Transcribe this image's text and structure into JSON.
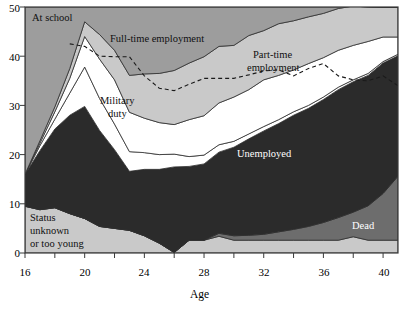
{
  "chart_data": {
    "type": "area",
    "title": "",
    "xlabel": "Age",
    "ylabel": "",
    "xlim": [
      16,
      41
    ],
    "ylim": [
      0,
      50
    ],
    "xticks": [
      16,
      20,
      24,
      28,
      32,
      36,
      40
    ],
    "xticks_minor_step": 2,
    "yticks": [
      0,
      10,
      20,
      30,
      40,
      50
    ],
    "grid": false,
    "legend": "inline-area-labels",
    "stacked": true,
    "x": [
      16,
      17,
      18,
      19,
      20,
      21,
      22,
      23,
      24,
      25,
      26,
      27,
      28,
      29,
      30,
      31,
      32,
      33,
      34,
      35,
      36,
      37,
      38,
      39,
      40,
      41
    ],
    "series": [
      {
        "name": "Status unknown or too young",
        "color": "#c9c9c9",
        "values": [
          9.5,
          8.8,
          9.2,
          8.0,
          7.0,
          5.4,
          5.0,
          4.6,
          3.5,
          2.0,
          0.1,
          2.6,
          2.6,
          3.4,
          2.6,
          2.6,
          2.6,
          2.6,
          2.6,
          2.6,
          2.6,
          2.6,
          3.3,
          2.6,
          2.6,
          2.6
        ]
      },
      {
        "name": "Dead",
        "color": "#6d6d6d",
        "values": [
          0,
          0,
          0,
          0,
          0,
          0,
          0,
          0,
          0,
          0,
          0,
          0,
          0,
          0.6,
          0.9,
          1.0,
          1.2,
          1.7,
          2.2,
          2.8,
          3.6,
          4.6,
          5.0,
          7.0,
          9.5,
          13.0
        ]
      },
      {
        "name": "Unemployed",
        "color": "#2b2b2b",
        "values": [
          6.5,
          12.0,
          16.0,
          20.0,
          22.8,
          19.5,
          16.0,
          12.0,
          13.5,
          15.0,
          17.4,
          15.0,
          15.5,
          16.5,
          18.0,
          19.6,
          21.0,
          22.0,
          23.2,
          24.0,
          25.0,
          26.0,
          26.5,
          26.5,
          26.5,
          24.5
        ]
      },
      {
        "name": "Military duty",
        "color": "#ffffff",
        "values": [
          0.0,
          1.0,
          2.0,
          4.5,
          8.0,
          6.5,
          5.2,
          4.0,
          3.4,
          3.0,
          2.6,
          2.0,
          1.8,
          1.5,
          1.2,
          1.0,
          0.9,
          0.8,
          0.7,
          0.6,
          0.5,
          0.5,
          0.4,
          0.4,
          0.3,
          0.3
        ]
      },
      {
        "name": "Full-time employment",
        "color": "#ffffff",
        "values": [
          0.0,
          0.5,
          1.5,
          3.0,
          6.2,
          8.0,
          9.0,
          8.0,
          7.0,
          6.5,
          6.0,
          7.5,
          8.0,
          8.5,
          9.0,
          9.0,
          9.5,
          9.0,
          8.5,
          8.5,
          8.0,
          7.5,
          7.0,
          6.5,
          5.0,
          3.5
        ]
      },
      {
        "name": "Part-time employment",
        "color": "#c9c9c9",
        "values": [
          0.0,
          0.5,
          1.0,
          2.0,
          3.0,
          5.0,
          6.0,
          7.5,
          9.0,
          10.0,
          11.0,
          11.5,
          12.0,
          11.5,
          10.5,
          11.0,
          10.0,
          10.5,
          10.0,
          9.5,
          9.0,
          8.5,
          8.0,
          7.0,
          6.0,
          6.0
        ]
      },
      {
        "name": "At school",
        "color": "#9d9d9d",
        "values": [
          34.0,
          27.2,
          20.3,
          12.5,
          3.0,
          5.6,
          8.8,
          13.9,
          13.6,
          13.5,
          12.9,
          11.4,
          10.1,
          8.0,
          7.8,
          5.8,
          4.8,
          3.4,
          2.8,
          2.0,
          1.3,
          0.3,
          0.0,
          0.0,
          0.0,
          0.0
        ]
      }
    ],
    "dashed_line": {
      "name": "military-fulltime-divider",
      "x": [
        19,
        20,
        21,
        22,
        23,
        24,
        25,
        26,
        27,
        28,
        29,
        30,
        31,
        32,
        33,
        34,
        35,
        36,
        37,
        38,
        39,
        40,
        41
      ],
      "y": [
        42.5,
        42.0,
        40.0,
        39.9,
        39.9,
        36.0,
        33.5,
        33.0,
        34.3,
        35.5,
        35.5,
        35.5,
        36.2,
        37.0,
        37.2,
        36.0,
        37.5,
        38.5,
        36.0,
        35.2,
        35.0,
        36.0,
        34.0
      ]
    }
  },
  "labels": {
    "at_school": "At school",
    "full_time": "Full-time employment",
    "part_time_l1": "Part-time",
    "part_time_l2": "employment",
    "military_l1": "Military",
    "military_l2": "duty",
    "unemployed": "Unemployed",
    "dead": "Dead",
    "status_l1": "Status",
    "status_l2": "unknown",
    "status_l3": "or too young",
    "xaxis_title": "Age"
  },
  "axis": {
    "y_ticks": [
      "50",
      "40",
      "30",
      "20",
      "10",
      "0"
    ],
    "x_ticks": [
      "16",
      "20",
      "24",
      "28",
      "32",
      "36",
      "40"
    ]
  }
}
